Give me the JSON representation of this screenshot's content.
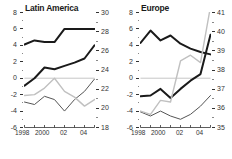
{
  "chart_data": [
    {
      "type": "line",
      "title": "Latin America",
      "panel": "left",
      "xlabel": "",
      "x": [
        1998,
        1999,
        2000,
        2001,
        2002,
        2003,
        2004,
        2005
      ],
      "xtick_values": [
        1998,
        1999,
        2000,
        2001,
        2002,
        2003,
        2004,
        2005
      ],
      "xtick_labels": [
        "1998",
        "",
        "2000",
        "",
        "02",
        "",
        "04",
        ""
      ],
      "xlim": [
        1998,
        2005
      ],
      "left_axis": {
        "label": "",
        "ylim": [
          -6,
          8
        ],
        "ticks": [
          8,
          6,
          4,
          2,
          0,
          -2,
          -4,
          -6
        ],
        "tick_labels": [
          "8",
          "6",
          "4",
          "2",
          "0",
          "-2",
          "-4",
          "-6"
        ],
        "minor_ticks": [
          7,
          5,
          3,
          1,
          -1,
          -3,
          -5
        ]
      },
      "right_axis": {
        "label": "",
        "ylim": [
          18,
          30
        ],
        "ticks": [
          30,
          28,
          26,
          24,
          22,
          20,
          18
        ],
        "tick_labels": [
          "30",
          "28",
          "26",
          "24",
          "22",
          "20",
          "18"
        ],
        "minor_ticks": [
          29,
          27,
          25,
          23,
          21,
          19
        ]
      },
      "zero_line": 0,
      "grid": false,
      "legend": "none",
      "series": [
        {
          "name": "series-black-upper",
          "axis": "left",
          "color": "#1a1a1a",
          "width": 2.0,
          "values": [
            4.1,
            4.6,
            4.4,
            4.4,
            6.0,
            6.0,
            6.0,
            6.0
          ]
        },
        {
          "name": "series-black-lower",
          "axis": "left",
          "color": "#1a1a1a",
          "width": 2.0,
          "values": [
            -0.9,
            0.0,
            1.3,
            1.1,
            1.5,
            1.9,
            2.4,
            4.0
          ]
        },
        {
          "name": "series-darkgray",
          "axis": "left",
          "color": "#555555",
          "width": 1.0,
          "values": [
            -2.9,
            -3.2,
            -2.2,
            -2.6,
            -4.0,
            -2.6,
            -1.6,
            -0.1
          ]
        },
        {
          "name": "series-lightgray",
          "axis": "left",
          "color": "#c0c0c0",
          "width": 1.4,
          "values": [
            -2.1,
            -2.0,
            -1.2,
            0.0,
            -1.6,
            -2.3,
            -3.4,
            -2.6
          ]
        }
      ]
    },
    {
      "type": "line",
      "title": "Europe",
      "panel": "right",
      "xlabel": "",
      "x": [
        1998,
        1999,
        2000,
        2001,
        2002,
        2003,
        2004,
        2005
      ],
      "xtick_values": [
        1998,
        1999,
        2000,
        2001,
        2002,
        2003,
        2004,
        2005
      ],
      "xtick_labels": [
        "1998",
        "",
        "2000",
        "",
        "02",
        "",
        "04",
        ""
      ],
      "xlim": [
        1998,
        2005
      ],
      "left_axis": {
        "label": "",
        "ylim": [
          -6,
          8
        ],
        "ticks": [
          8,
          6,
          4,
          2,
          0,
          -2,
          -4,
          -6
        ],
        "tick_labels": [
          "8",
          "6",
          "4",
          "2",
          "0",
          "-2",
          "-4",
          "-6"
        ],
        "minor_ticks": [
          7,
          5,
          3,
          1,
          -1,
          -3,
          -5
        ]
      },
      "right_axis": {
        "label": "",
        "ylim": [
          35,
          41
        ],
        "ticks": [
          41,
          40,
          39,
          38,
          37,
          36,
          35
        ],
        "tick_labels": [
          "41",
          "40",
          "39",
          "38",
          "37",
          "36",
          "35"
        ],
        "minor_ticks": [
          40.5,
          39.5,
          38.5,
          37.5,
          36.5,
          35.5
        ]
      },
      "zero_line": 0,
      "grid": false,
      "legend": "none",
      "series": [
        {
          "name": "series-black-upper",
          "axis": "left",
          "color": "#1a1a1a",
          "width": 2.0,
          "values": [
            4.3,
            5.8,
            4.6,
            5.2,
            4.2,
            3.6,
            3.2,
            2.9
          ]
        },
        {
          "name": "series-black-lower",
          "axis": "left",
          "color": "#1a1a1a",
          "width": 2.0,
          "values": [
            -2.2,
            -2.1,
            -1.3,
            -2.4,
            -1.3,
            -0.3,
            0.5,
            5.3
          ]
        },
        {
          "name": "series-darkgray",
          "axis": "left",
          "color": "#555555",
          "width": 1.0,
          "values": [
            -4.1,
            -4.6,
            -4.0,
            -4.6,
            -5.0,
            -4.4,
            -3.4,
            -2.1
          ]
        },
        {
          "name": "series-lightgray",
          "axis": "left",
          "color": "#c0c0c0",
          "width": 1.4,
          "values": [
            -4.0,
            -4.4,
            -2.7,
            -2.9,
            2.1,
            2.8,
            1.9,
            12.0
          ]
        }
      ]
    }
  ]
}
